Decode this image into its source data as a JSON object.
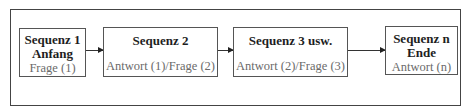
{
  "diagram": {
    "type": "flow",
    "direction": "left-to-right",
    "nodes": [
      {
        "id": "seq1",
        "title_lines": [
          "Sequenz 1",
          "Anfang"
        ],
        "subtitle": "Frage (1)"
      },
      {
        "id": "seq2",
        "title_lines": [
          "Sequenz 2"
        ],
        "subtitle": "Antwort (1)/Frage (2)"
      },
      {
        "id": "seq3",
        "title_lines": [
          "Sequenz 3 usw."
        ],
        "subtitle": "Antwort (2)/Frage (3)"
      },
      {
        "id": "seqn",
        "title_lines": [
          "Sequenz n",
          "Ende"
        ],
        "subtitle": "Antwort (n)"
      }
    ],
    "edges": [
      {
        "from": "seq1",
        "to": "seq2"
      },
      {
        "from": "seq2",
        "to": "seq3"
      },
      {
        "from": "seq3",
        "to": "seqn"
      }
    ],
    "colors": {
      "border": "#555555",
      "title_text": "#1e1e1e",
      "subtitle_text": "#6a6a6a",
      "arrow": "#222222"
    }
  }
}
